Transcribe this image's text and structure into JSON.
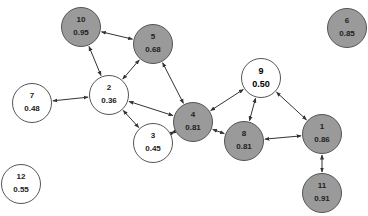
{
  "diagram": {
    "type": "network graph",
    "colors": {
      "gray_fill": "#9a9a9a",
      "white_fill": "#ffffff",
      "edge": "#333333"
    },
    "nodes": [
      {
        "id": "1",
        "label": "1",
        "value": "0.86",
        "x": 322,
        "y": 134,
        "fill": "gray"
      },
      {
        "id": "2",
        "label": "2",
        "value": "0.36",
        "x": 109,
        "y": 95,
        "fill": "white"
      },
      {
        "id": "3",
        "label": "3",
        "value": "0.45",
        "x": 153,
        "y": 143,
        "fill": "white"
      },
      {
        "id": "4",
        "label": "4",
        "value": "0.81",
        "x": 193,
        "y": 122,
        "fill": "gray"
      },
      {
        "id": "5",
        "label": "5",
        "value": "0.68",
        "x": 153,
        "y": 44,
        "fill": "gray"
      },
      {
        "id": "6",
        "label": "6",
        "value": "0.85",
        "x": 347,
        "y": 28,
        "fill": "gray"
      },
      {
        "id": "7",
        "label": "7",
        "value": "0.48",
        "x": 32,
        "y": 103,
        "fill": "white"
      },
      {
        "id": "8",
        "label": "8",
        "value": "0.81",
        "x": 244,
        "y": 141,
        "fill": "gray"
      },
      {
        "id": "9",
        "label": "9",
        "value": "0.50",
        "x": 261,
        "y": 78,
        "fill": "white",
        "bold": true
      },
      {
        "id": "10",
        "label": "10",
        "value": "0.95",
        "x": 81,
        "y": 27,
        "fill": "gray"
      },
      {
        "id": "11",
        "label": "11",
        "value": "0.91",
        "x": 322,
        "y": 193,
        "fill": "gray"
      },
      {
        "id": "12",
        "label": "12",
        "value": "0.55",
        "x": 21,
        "y": 184,
        "fill": "white"
      }
    ],
    "edges": [
      {
        "from": "10",
        "to": "5"
      },
      {
        "from": "10",
        "to": "2"
      },
      {
        "from": "5",
        "to": "2"
      },
      {
        "from": "5",
        "to": "4"
      },
      {
        "from": "2",
        "to": "7"
      },
      {
        "from": "2",
        "to": "4"
      },
      {
        "from": "2",
        "to": "3"
      },
      {
        "from": "3",
        "to": "4"
      },
      {
        "from": "4",
        "to": "9"
      },
      {
        "from": "4",
        "to": "8"
      },
      {
        "from": "9",
        "to": "8"
      },
      {
        "from": "9",
        "to": "1"
      },
      {
        "from": "8",
        "to": "1"
      },
      {
        "from": "1",
        "to": "11"
      }
    ]
  }
}
